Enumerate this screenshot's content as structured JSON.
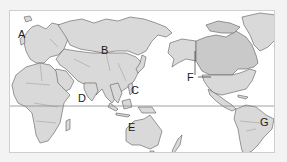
{
  "map": {
    "type": "world map (Pacific-centered)",
    "equator_line": true,
    "colors": {
      "background": "#f3f3f3",
      "ocean": "#ffffff",
      "land": "#d9d9d9",
      "land_highlight": "#c9c9c9",
      "outline": "#5a5a5a"
    },
    "labels": [
      {
        "id": "A",
        "text": "A",
        "x": 17,
        "y": 28
      },
      {
        "id": "B",
        "text": "B",
        "x": 100,
        "y": 44
      },
      {
        "id": "C",
        "text": "C",
        "x": 130,
        "y": 84
      },
      {
        "id": "D",
        "text": "D",
        "x": 77,
        "y": 92
      },
      {
        "id": "E",
        "text": "E",
        "x": 127,
        "y": 121
      },
      {
        "id": "F",
        "text": "F",
        "x": 186,
        "y": 71
      },
      {
        "id": "G",
        "text": "G",
        "x": 261,
        "y": 116
      }
    ]
  }
}
